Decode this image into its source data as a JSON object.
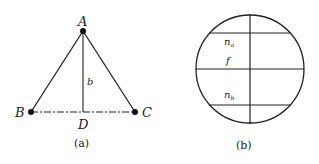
{
  "figure_a": {
    "caption": "(a)",
    "points": {
      "A": "A",
      "B": "B",
      "C": "C",
      "D": "D"
    },
    "height_label": "b"
  },
  "figure_b": {
    "caption": "(b)",
    "labels": {
      "na_base": "n",
      "na_sub": "a",
      "f": "f",
      "nb_base": "n",
      "nb_sub": "b"
    }
  },
  "colors": {
    "stroke": "#222222",
    "background": "#ffffff"
  }
}
